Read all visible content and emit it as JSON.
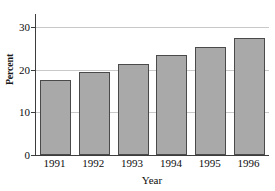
{
  "chart_data": {
    "type": "bar",
    "title": "",
    "subtitle": "",
    "xlabel": "Year",
    "ylabel": "Percent",
    "categories": [
      "1991",
      "1992",
      "1993",
      "1994",
      "1995",
      "1996"
    ],
    "values": [
      17.5,
      19.5,
      21.4,
      23.4,
      25.3,
      27.3
    ],
    "series": [
      {
        "name": "Percent",
        "values": [
          17.5,
          19.5,
          21.4,
          23.4,
          25.3,
          27.3
        ]
      }
    ],
    "ylim": [
      0,
      33
    ],
    "yticks": [
      0,
      10,
      20,
      30
    ],
    "ytick_labels": [
      "0",
      "10",
      "20",
      "30"
    ],
    "xtick_labels": [
      "1991",
      "1992",
      "1993",
      "1994",
      "1995",
      "1996"
    ],
    "grid": "horizontal",
    "legend": "none",
    "annotations": [],
    "colors": {
      "bar_fill": "#a9a9a9",
      "bar_border": "#4a4a4a",
      "axis": "#3d3d3d",
      "gridline": "#c9c9c9",
      "text": "#0d0d0d",
      "background": "#ffffff"
    }
  }
}
